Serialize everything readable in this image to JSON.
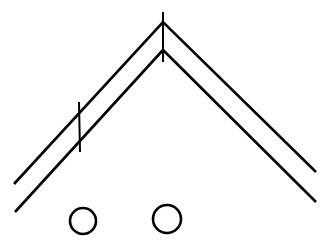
{
  "diagram": {
    "width": 329,
    "height": 244,
    "background": "#ffffff",
    "stroke_color": "#000000",
    "stroke_width": 2.6,
    "tick_width": 2.0,
    "chevrons": [
      {
        "id": "outer-chevron",
        "points": [
          [
            14,
            184
          ],
          [
            163,
            22
          ],
          [
            316,
            172
          ]
        ]
      },
      {
        "id": "inner-chevron",
        "points": [
          [
            15,
            212
          ],
          [
            163,
            50
          ],
          [
            316,
            202
          ]
        ]
      }
    ],
    "ticks": [
      {
        "id": "apex-tick",
        "x1": 163,
        "y1": 12,
        "x2": 163,
        "y2": 62
      },
      {
        "id": "left-tick",
        "x1": 79,
        "y1": 102,
        "x2": 80,
        "y2": 152
      }
    ],
    "circles": [
      {
        "id": "circle-left",
        "cx": 83,
        "cy": 221,
        "r": 13
      },
      {
        "id": "circle-right",
        "cx": 167,
        "cy": 219,
        "r": 14
      }
    ]
  }
}
